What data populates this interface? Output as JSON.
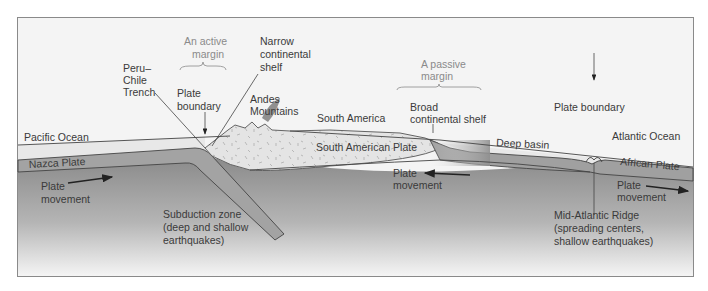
{
  "diagram": {
    "colors": {
      "frame_bg": "#f4f4f4",
      "frame_border": "#8a8a8a",
      "ocean_water": "#e6e6e6",
      "oceanic_plate": "#9b9b9b",
      "mantle_top": "#8c8c8c",
      "mantle_bottom": "#f2f2f2",
      "continental_crust": "#e2e2e2",
      "text": "#3a3a3a",
      "accent_text": "#8a8a8a"
    },
    "labels": {
      "active_margin_line1": "An active",
      "active_margin_line2": "margin",
      "narrow_shelf_line1": "Narrow",
      "narrow_shelf_line2": "continental",
      "narrow_shelf_line3": "shelf",
      "peru_chile_line1": "Peru–",
      "peru_chile_line2": "Chile",
      "peru_chile_line3": "Trench",
      "plate_boundary_left_line1": "Plate",
      "plate_boundary_left_line2": "boundary",
      "andes_line1": "Andes",
      "andes_line2": "Mountains",
      "south_america": "South America",
      "passive_margin_line1": "A passive",
      "passive_margin_line2": "margin",
      "broad_shelf_line1": "Broad",
      "broad_shelf_line2": "continental shelf",
      "plate_boundary_right": "Plate boundary",
      "pacific_ocean": "Pacific Ocean",
      "atlantic_ocean": "Atlantic Ocean",
      "nazca_plate": "Nazca Plate",
      "south_american_plate": "South American Plate",
      "deep_basin": "Deep basin",
      "african_plate": "African Plate",
      "plate_movement_left_line1": "Plate",
      "plate_movement_left_line2": "movement",
      "plate_movement_center_line1": "Plate",
      "plate_movement_center_line2": "movement",
      "plate_movement_right_line1": "Plate",
      "plate_movement_right_line2": "movement",
      "subduction_line1": "Subduction zone",
      "subduction_line2": "(deep and shallow",
      "subduction_line3": "earthquakes)",
      "ridge_line1": "Mid-Atlantic Ridge",
      "ridge_line2": "(spreading centers,",
      "ridge_line3": "shallow earthquakes)"
    },
    "arrows": {
      "left_direction": "right",
      "center_direction": "left",
      "right_direction": "right"
    }
  }
}
